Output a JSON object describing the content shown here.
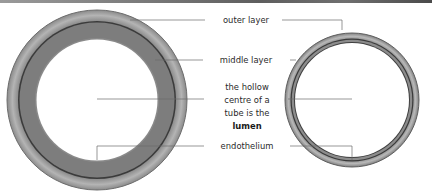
{
  "diagram": {
    "labels": {
      "outer_layer": "outer layer",
      "middle_layer": "middle layer",
      "lumen_line1": "the hollow",
      "lumen_line2": "centre of a",
      "lumen_line3": "tube is the",
      "lumen_term": "lumen",
      "endothelium": "endothelium"
    },
    "shapes": [
      {
        "name": "thick-walled tube",
        "position": "left",
        "wall": "thick"
      },
      {
        "name": "thin-walled tube",
        "position": "right",
        "wall": "thin"
      }
    ],
    "colors": {
      "outer_layer": "#a9a9a9",
      "middle_layer": "#7b7b7b",
      "dark_line": "#3a3a3a",
      "lumen": "#ffffff",
      "leader_line": "#6a6a6a"
    }
  }
}
